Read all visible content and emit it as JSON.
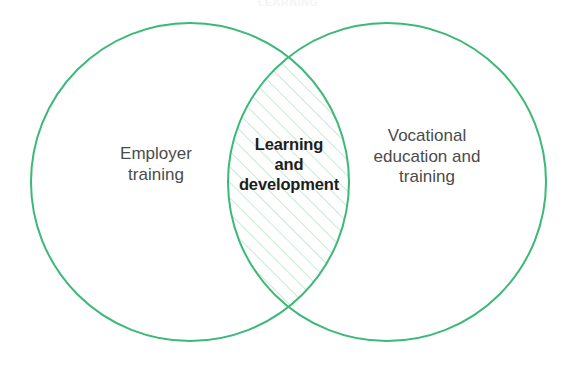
{
  "diagram": {
    "type": "venn",
    "title_fragment": "LEARNING",
    "background_color": "#ffffff",
    "circle_stroke_color": "#3cb878",
    "circle_stroke_width": 2,
    "hatch_color": "#8fd6ae",
    "hatch_angle_degrees": 45,
    "hatch_spacing_px": 11,
    "sets": [
      {
        "id": "left",
        "label": "Employer\ntraining",
        "text_color": "#4b4b4b",
        "center_x": 190,
        "center_y": 182,
        "radius": 159
      },
      {
        "id": "right",
        "label": "Vocational\neducation and\ntraining",
        "text_color": "#4b4b4b",
        "center_x": 387,
        "center_y": 182,
        "radius": 159
      }
    ],
    "intersection": {
      "id": "center",
      "label": "Learning\nand\ndevelopment",
      "text_color": "#1d1d1b",
      "bold": true,
      "fill": "hatched",
      "top_point_x": 288,
      "top_point_y": 52,
      "bottom_point_x": 288,
      "bottom_point_y": 312
    }
  }
}
